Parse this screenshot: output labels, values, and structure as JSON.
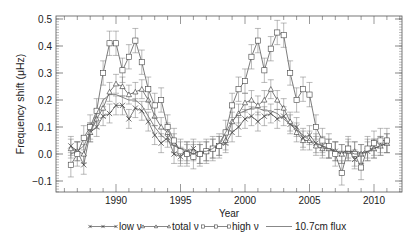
{
  "chart_data": {
    "type": "line",
    "title": "",
    "xlabel": "Year",
    "ylabel": "Frequency shift (μHz)",
    "xlim": [
      1985.4,
      2012.2
    ],
    "ylim": [
      -0.14,
      0.51
    ],
    "xticks": [
      1990,
      1995,
      2000,
      2005,
      2010
    ],
    "xtick_labels": [
      "1990",
      "1995",
      "2000",
      "2005",
      "2010"
    ],
    "yticks": [
      -0.1,
      0.0,
      0.1,
      0.2,
      0.3,
      0.4,
      0.5
    ],
    "ytick_labels": [
      "−0.1",
      "0.0",
      "0.1",
      "0.2",
      "0.3",
      "0.4",
      "0.5"
    ],
    "grid": false,
    "legend_position": "bottom",
    "x": [
      1986.5,
      1987.0,
      1987.5,
      1988.0,
      1988.5,
      1989.0,
      1989.5,
      1990.0,
      1990.5,
      1991.0,
      1991.5,
      1992.0,
      1992.5,
      1993.0,
      1993.5,
      1994.0,
      1994.5,
      1995.0,
      1995.5,
      1996.0,
      1996.5,
      1997.0,
      1997.5,
      1998.0,
      1998.5,
      1999.0,
      1999.5,
      2000.0,
      2000.5,
      2001.0,
      2001.5,
      2002.0,
      2002.5,
      2003.0,
      2003.5,
      2004.0,
      2004.5,
      2005.0,
      2005.5,
      2006.0,
      2006.5,
      2007.0,
      2007.5,
      2008.0,
      2008.5,
      2009.0,
      2009.5,
      2010.0,
      2010.5,
      2011.0
    ],
    "series": [
      {
        "name": "low ν",
        "marker": "x",
        "values": [
          0.03,
          0.01,
          -0.04,
          0.08,
          0.1,
          0.14,
          0.15,
          0.18,
          0.18,
          0.13,
          0.17,
          0.16,
          0.12,
          0.07,
          0.04,
          0.06,
          0.0,
          -0.01,
          0.01,
          0.02,
          0.0,
          0.01,
          0.02,
          0.03,
          0.04,
          0.08,
          0.1,
          0.13,
          0.14,
          0.12,
          0.14,
          0.15,
          0.13,
          0.14,
          0.11,
          0.1,
          0.06,
          0.07,
          0.04,
          0.03,
          0.02,
          0.01,
          0.0,
          0.02,
          -0.02,
          0.0,
          0.01,
          0.02,
          0.03,
          0.04
        ]
      },
      {
        "name": "total ν",
        "marker": "triangle",
        "values": [
          0.02,
          0.01,
          0.0,
          0.08,
          0.13,
          0.17,
          0.23,
          0.26,
          0.25,
          0.22,
          0.23,
          0.24,
          0.2,
          0.14,
          0.1,
          0.08,
          0.04,
          0.01,
          0.0,
          0.01,
          0.0,
          0.01,
          0.02,
          0.03,
          0.05,
          0.12,
          0.15,
          0.19,
          0.2,
          0.18,
          0.2,
          0.24,
          0.2,
          0.17,
          0.12,
          0.08,
          0.05,
          0.05,
          0.03,
          0.02,
          0.02,
          0.01,
          0.0,
          0.01,
          0.01,
          0.0,
          0.02,
          0.02,
          0.03,
          0.04
        ]
      },
      {
        "name": "high ν",
        "marker": "square",
        "values": [
          -0.04,
          0.0,
          0.06,
          0.1,
          0.16,
          0.3,
          0.41,
          0.41,
          0.31,
          0.36,
          0.42,
          0.34,
          0.24,
          0.18,
          0.2,
          0.1,
          0.05,
          0.01,
          0.0,
          -0.01,
          0.0,
          0.01,
          0.02,
          0.03,
          0.08,
          0.18,
          0.24,
          0.27,
          0.36,
          0.42,
          0.31,
          0.39,
          0.45,
          0.44,
          0.3,
          0.2,
          0.24,
          0.22,
          0.1,
          0.05,
          0.03,
          0.0,
          -0.07,
          0.02,
          0.0,
          -0.05,
          0.02,
          0.04,
          0.05,
          0.05
        ]
      },
      {
        "name": "10.7cm flux",
        "marker": "none",
        "values": [
          0.0,
          0.01,
          0.03,
          0.08,
          0.15,
          0.2,
          0.22,
          0.22,
          0.21,
          0.2,
          0.2,
          0.18,
          0.14,
          0.1,
          0.07,
          0.05,
          0.03,
          0.02,
          0.01,
          0.0,
          0.01,
          0.01,
          0.02,
          0.04,
          0.08,
          0.12,
          0.15,
          0.16,
          0.17,
          0.17,
          0.16,
          0.16,
          0.15,
          0.13,
          0.11,
          0.09,
          0.07,
          0.05,
          0.04,
          0.03,
          0.02,
          0.01,
          0.01,
          0.01,
          0.0,
          0.0,
          0.01,
          0.02,
          0.03,
          0.04
        ]
      }
    ]
  },
  "legend": {
    "items": [
      {
        "label": "low ν",
        "marker": "x"
      },
      {
        "label": "total ν",
        "marker": "triangle"
      },
      {
        "label": "high ν",
        "marker": "square"
      },
      {
        "label": "10.7cm flux",
        "marker": "none"
      }
    ]
  },
  "axes": {
    "xlabel": "Year",
    "ylabel": "Frequency shift (μHz)"
  }
}
